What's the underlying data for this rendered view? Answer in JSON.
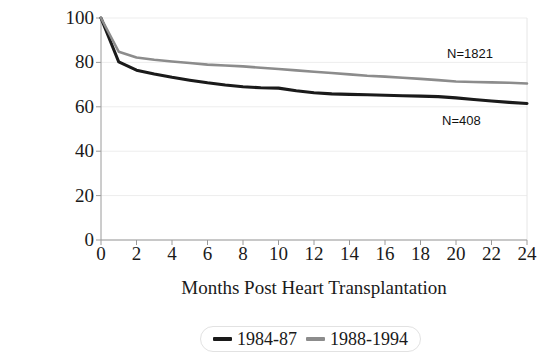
{
  "chart_data": {
    "type": "line",
    "title": "",
    "xlabel": "Months Post Heart Transplantation",
    "ylabel": "Survival (%)",
    "xlim": [
      0,
      24
    ],
    "ylim": [
      0,
      100
    ],
    "xticks": [
      0,
      2,
      4,
      6,
      8,
      10,
      12,
      14,
      16,
      18,
      20,
      22,
      24
    ],
    "yticks": [
      0,
      20,
      40,
      60,
      80,
      100
    ],
    "grid": "horizontal-faint",
    "legend_position": "below-plot-center",
    "series": [
      {
        "name": "1984-87",
        "color": "#1a1a1a",
        "n_label": "N=408",
        "x": [
          0,
          1,
          2,
          3,
          4,
          5,
          6,
          7,
          8,
          9,
          10,
          11,
          12,
          13,
          14,
          15,
          16,
          17,
          18,
          19,
          20,
          21,
          22,
          23,
          24
        ],
        "values": [
          100,
          80.2,
          76.5,
          74.8,
          73.3,
          72.0,
          70.8,
          69.8,
          69.0,
          68.6,
          68.4,
          67.2,
          66.3,
          65.8,
          65.6,
          65.4,
          65.2,
          65.0,
          64.8,
          64.6,
          64.0,
          63.3,
          62.6,
          62.0,
          61.5
        ]
      },
      {
        "name": "1988-1994",
        "color": "#8c8c8c",
        "n_label": "N=1821",
        "x": [
          0,
          1,
          2,
          3,
          4,
          5,
          6,
          7,
          8,
          9,
          10,
          11,
          12,
          13,
          14,
          15,
          16,
          17,
          18,
          19,
          20,
          21,
          22,
          23,
          24
        ],
        "values": [
          100,
          84.8,
          82.2,
          81.2,
          80.4,
          79.7,
          79.0,
          78.6,
          78.2,
          77.6,
          77.0,
          76.4,
          75.8,
          75.2,
          74.6,
          74.0,
          73.6,
          73.1,
          72.6,
          72.0,
          71.4,
          71.2,
          71.0,
          70.8,
          70.5
        ]
      }
    ],
    "annotations": [
      {
        "text": "N=1821",
        "x": 20.5,
        "y": 86
      },
      {
        "text": "N=408",
        "x": 20.0,
        "y": 56
      }
    ]
  },
  "axis": {
    "y_title": "Survival (%)",
    "x_title": "Months Post Heart Transplantation",
    "y_tick_labels": [
      "100",
      "80",
      "60",
      "40",
      "20",
      "0"
    ],
    "x_tick_labels": [
      "0",
      "2",
      "4",
      "6",
      "8",
      "10",
      "12",
      "14",
      "16",
      "18",
      "20",
      "22",
      "24"
    ]
  },
  "legend": {
    "items": [
      {
        "label": "1984-87",
        "color": "#1a1a1a"
      },
      {
        "label": "1988-1994",
        "color": "#8c8c8c"
      }
    ]
  },
  "annotations": {
    "upper": "N=1821",
    "lower": "N=408"
  },
  "colors": {
    "series_early": "#1a1a1a",
    "series_late": "#8c8c8c",
    "axis": "#9a9a9a",
    "grid": "#ededed",
    "text": "#1a1a1a",
    "background": "#ffffff"
  }
}
